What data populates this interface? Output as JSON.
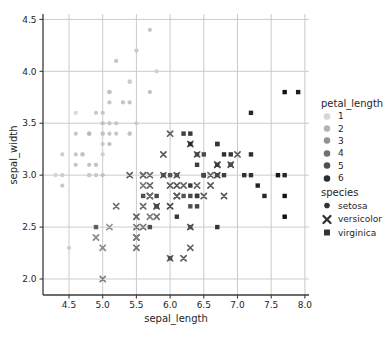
{
  "chart_data": {
    "type": "scatter",
    "title": "",
    "xlabel": "sepal_length",
    "ylabel": "sepal_width",
    "xlim": [
      4.114,
      8.061
    ],
    "ylim": [
      1.846,
      4.552
    ],
    "xticks": [
      4.5,
      5.0,
      5.5,
      6.0,
      6.5,
      7.0,
      7.5,
      8.0
    ],
    "xtick_labels": [
      "4.5",
      "5.0",
      "5.5",
      "6.0",
      "6.5",
      "7.0",
      "7.5",
      "8.0"
    ],
    "yticks": [
      2.0,
      2.5,
      3.0,
      3.5,
      4.0,
      4.5
    ],
    "ytick_labels": [
      "2.0",
      "2.5",
      "3.0",
      "3.5",
      "4.0",
      "4.5"
    ],
    "grid": true,
    "legend_position": "right",
    "colors": {
      "background": "#ffffff",
      "grid": "#cbcbcb",
      "spine": "#3a3a3a",
      "text": "#262626",
      "hue_light": "#d6d6d6",
      "hue_dark": "#0d0d0d",
      "marker_dark": "#333333"
    },
    "hue": {
      "field": "petal_length",
      "title": "petal_length",
      "levels": [
        1,
        2,
        3,
        4,
        5,
        6
      ],
      "domain": [
        1.0,
        6.9
      ]
    },
    "style": {
      "field": "species",
      "title": "species",
      "levels": [
        "setosa",
        "versicolor",
        "virginica"
      ],
      "markers": [
        "circle",
        "x",
        "square"
      ]
    },
    "point_format": [
      "sepal_length",
      "sepal_width",
      "petal_length"
    ],
    "series": [
      {
        "name": "setosa",
        "marker": "circle",
        "points": [
          [
            5.1,
            3.5,
            1.4
          ],
          [
            4.9,
            3.0,
            1.4
          ],
          [
            4.7,
            3.2,
            1.3
          ],
          [
            4.6,
            3.1,
            1.5
          ],
          [
            5.0,
            3.6,
            1.4
          ],
          [
            5.4,
            3.9,
            1.7
          ],
          [
            4.6,
            3.4,
            1.4
          ],
          [
            5.0,
            3.4,
            1.5
          ],
          [
            4.4,
            2.9,
            1.4
          ],
          [
            4.9,
            3.1,
            1.5
          ],
          [
            5.4,
            3.7,
            1.5
          ],
          [
            4.8,
            3.4,
            1.6
          ],
          [
            4.8,
            3.0,
            1.4
          ],
          [
            4.3,
            3.0,
            1.1
          ],
          [
            5.8,
            4.0,
            1.2
          ],
          [
            5.7,
            4.4,
            1.5
          ],
          [
            5.4,
            3.9,
            1.3
          ],
          [
            5.1,
            3.5,
            1.4
          ],
          [
            5.7,
            3.8,
            1.7
          ],
          [
            5.1,
            3.8,
            1.5
          ],
          [
            5.4,
            3.4,
            1.7
          ],
          [
            5.1,
            3.7,
            1.5
          ],
          [
            4.6,
            3.6,
            1.0
          ],
          [
            5.1,
            3.3,
            1.7
          ],
          [
            4.8,
            3.4,
            1.9
          ],
          [
            5.0,
            3.0,
            1.6
          ],
          [
            5.0,
            3.4,
            1.6
          ],
          [
            5.2,
            3.5,
            1.5
          ],
          [
            5.2,
            3.4,
            1.4
          ],
          [
            4.7,
            3.2,
            1.6
          ],
          [
            4.8,
            3.1,
            1.6
          ],
          [
            5.4,
            3.4,
            1.5
          ],
          [
            5.2,
            4.1,
            1.5
          ],
          [
            5.5,
            4.2,
            1.4
          ],
          [
            4.9,
            3.1,
            1.5
          ],
          [
            5.0,
            3.2,
            1.2
          ],
          [
            5.5,
            3.5,
            1.3
          ],
          [
            4.9,
            3.6,
            1.4
          ],
          [
            4.4,
            3.0,
            1.3
          ],
          [
            5.1,
            3.4,
            1.5
          ],
          [
            5.0,
            3.5,
            1.3
          ],
          [
            4.5,
            2.3,
            1.3
          ],
          [
            4.4,
            3.2,
            1.3
          ],
          [
            5.0,
            3.5,
            1.6
          ],
          [
            5.1,
            3.8,
            1.9
          ],
          [
            4.8,
            3.0,
            1.4
          ],
          [
            5.1,
            3.8,
            1.6
          ],
          [
            4.6,
            3.2,
            1.4
          ],
          [
            5.3,
            3.7,
            1.5
          ],
          [
            5.0,
            3.3,
            1.4
          ]
        ]
      },
      {
        "name": "versicolor",
        "marker": "x",
        "points": [
          [
            7.0,
            3.2,
            4.7
          ],
          [
            6.4,
            3.2,
            4.5
          ],
          [
            6.9,
            3.1,
            4.9
          ],
          [
            5.5,
            2.3,
            4.0
          ],
          [
            6.5,
            2.8,
            4.6
          ],
          [
            5.7,
            2.8,
            4.5
          ],
          [
            6.3,
            3.3,
            4.7
          ],
          [
            4.9,
            2.4,
            3.3
          ],
          [
            6.6,
            2.9,
            4.6
          ],
          [
            5.2,
            2.7,
            3.9
          ],
          [
            5.0,
            2.0,
            3.5
          ],
          [
            5.9,
            3.0,
            4.2
          ],
          [
            6.0,
            2.2,
            4.0
          ],
          [
            6.1,
            2.9,
            4.7
          ],
          [
            5.6,
            2.9,
            3.6
          ],
          [
            6.7,
            3.1,
            4.4
          ],
          [
            5.6,
            3.0,
            4.5
          ],
          [
            5.8,
            2.7,
            4.1
          ],
          [
            6.2,
            2.2,
            4.5
          ],
          [
            5.6,
            2.5,
            3.9
          ],
          [
            5.9,
            3.2,
            4.8
          ],
          [
            6.1,
            2.8,
            4.0
          ],
          [
            6.3,
            2.5,
            4.9
          ],
          [
            6.1,
            2.8,
            4.7
          ],
          [
            6.4,
            2.9,
            4.3
          ],
          [
            6.6,
            3.0,
            4.4
          ],
          [
            6.8,
            2.8,
            4.8
          ],
          [
            6.7,
            3.0,
            5.0
          ],
          [
            6.0,
            2.9,
            4.5
          ],
          [
            5.7,
            2.6,
            3.5
          ],
          [
            5.5,
            2.4,
            3.8
          ],
          [
            5.5,
            2.4,
            3.7
          ],
          [
            5.8,
            2.7,
            3.9
          ],
          [
            6.0,
            2.7,
            5.1
          ],
          [
            5.4,
            3.0,
            4.5
          ],
          [
            6.0,
            3.4,
            4.5
          ],
          [
            6.7,
            3.1,
            4.7
          ],
          [
            6.3,
            2.3,
            4.4
          ],
          [
            5.6,
            3.0,
            4.1
          ],
          [
            5.5,
            2.5,
            4.0
          ],
          [
            5.5,
            2.6,
            4.4
          ],
          [
            6.1,
            3.0,
            4.6
          ],
          [
            5.8,
            2.6,
            4.0
          ],
          [
            5.0,
            2.3,
            3.3
          ],
          [
            5.6,
            2.7,
            4.2
          ],
          [
            5.7,
            3.0,
            4.2
          ],
          [
            5.7,
            2.9,
            4.2
          ],
          [
            6.2,
            2.9,
            4.3
          ],
          [
            5.1,
            2.5,
            3.0
          ],
          [
            5.7,
            2.8,
            4.1
          ]
        ]
      },
      {
        "name": "virginica",
        "marker": "square",
        "points": [
          [
            6.3,
            3.3,
            6.0
          ],
          [
            5.8,
            2.7,
            5.1
          ],
          [
            7.1,
            3.0,
            5.9
          ],
          [
            6.3,
            2.9,
            5.6
          ],
          [
            6.5,
            3.0,
            5.8
          ],
          [
            7.6,
            3.0,
            6.6
          ],
          [
            4.9,
            2.5,
            4.5
          ],
          [
            7.3,
            2.9,
            6.3
          ],
          [
            6.7,
            2.5,
            5.8
          ],
          [
            7.2,
            3.6,
            6.1
          ],
          [
            6.5,
            3.2,
            5.1
          ],
          [
            6.4,
            2.7,
            5.3
          ],
          [
            6.8,
            3.0,
            5.5
          ],
          [
            5.7,
            2.5,
            5.0
          ],
          [
            5.8,
            2.8,
            5.1
          ],
          [
            6.4,
            3.2,
            5.3
          ],
          [
            6.5,
            3.0,
            5.5
          ],
          [
            7.7,
            3.8,
            6.7
          ],
          [
            7.7,
            2.6,
            6.9
          ],
          [
            6.0,
            2.2,
            5.0
          ],
          [
            6.9,
            3.2,
            5.7
          ],
          [
            5.6,
            2.8,
            4.9
          ],
          [
            7.7,
            2.8,
            6.7
          ],
          [
            6.3,
            2.7,
            4.9
          ],
          [
            6.7,
            3.3,
            5.7
          ],
          [
            7.2,
            3.2,
            6.0
          ],
          [
            6.2,
            2.8,
            4.8
          ],
          [
            6.1,
            3.0,
            4.9
          ],
          [
            6.4,
            2.8,
            5.6
          ],
          [
            7.2,
            3.0,
            5.8
          ],
          [
            7.4,
            2.8,
            6.1
          ],
          [
            7.9,
            3.8,
            6.4
          ],
          [
            6.4,
            2.8,
            5.6
          ],
          [
            6.3,
            2.8,
            5.1
          ],
          [
            6.1,
            2.6,
            5.6
          ],
          [
            7.7,
            3.0,
            6.1
          ],
          [
            6.3,
            3.4,
            5.6
          ],
          [
            6.4,
            3.1,
            5.5
          ],
          [
            6.0,
            3.0,
            4.8
          ],
          [
            6.9,
            3.1,
            5.4
          ],
          [
            6.7,
            3.1,
            5.6
          ],
          [
            6.9,
            3.1,
            5.1
          ],
          [
            5.8,
            2.7,
            5.1
          ],
          [
            6.8,
            3.2,
            5.9
          ],
          [
            6.7,
            3.3,
            5.7
          ],
          [
            6.7,
            3.0,
            5.2
          ],
          [
            6.3,
            2.5,
            5.0
          ],
          [
            6.5,
            3.0,
            5.2
          ],
          [
            6.2,
            3.4,
            5.4
          ],
          [
            5.9,
            3.0,
            5.1
          ]
        ]
      }
    ]
  }
}
